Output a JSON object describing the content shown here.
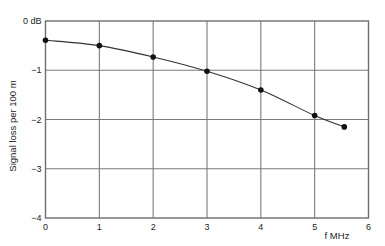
{
  "chart_data": {
    "type": "line",
    "title": "",
    "xlabel": "f MHz",
    "ylabel": "Signal loss per 100 m",
    "xlim": [
      0,
      6
    ],
    "ylim": [
      -4,
      0
    ],
    "x_ticks": [
      "0",
      "1",
      "2",
      "3",
      "4",
      "5",
      "6"
    ],
    "y_ticks": [
      "0 dB",
      "−1",
      "−2",
      "−3",
      "−4"
    ],
    "grid": true,
    "legend": null,
    "series": [
      {
        "name": "Signal loss",
        "x": [
          0,
          1,
          2,
          3,
          4,
          5,
          5.55
        ],
        "y": [
          -0.39,
          -0.5,
          -0.73,
          -1.02,
          -1.4,
          -1.92,
          -2.15
        ],
        "marker": "circle",
        "color": "#222222"
      }
    ]
  },
  "colors": {
    "grid": "#7a7a7a",
    "frame": "#6e6e6e",
    "line": "#333333",
    "marker": "#111111"
  }
}
